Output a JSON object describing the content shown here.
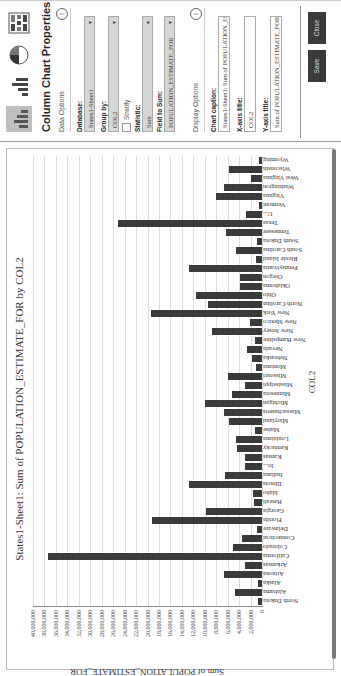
{
  "chart_data": {
    "type": "bar",
    "title": "States1-Sheet1: Sum of POPULATION_ESTIMATE_FOR by COL2",
    "xlabel": "COL2",
    "ylabel": "Sum of POPULATION_ESTIMATE_FOR",
    "ylim": [
      0,
      40000000
    ],
    "yticks": [
      "0",
      "2,000,000",
      "4,000,000",
      "6,000,000",
      "8,000,000",
      "10,000,000",
      "12,000,000",
      "14,000,000",
      "16,000,000",
      "18,000,000",
      "20,000,000",
      "22,000,000",
      "24,000,000",
      "26,000,000",
      "28,000,000",
      "30,000,000",
      "32,000,000",
      "34,000,000",
      "36,000,000",
      "38,000,000",
      "40,000,000"
    ],
    "grid": true,
    "legend": "none",
    "categories": [
      "North Dakota",
      "Alabama",
      "Alaska",
      "Arizona",
      "Arkansas",
      "California",
      "Colorado",
      "Connecticut",
      "Delaware",
      "Florida",
      "Georgia",
      "Hawaii",
      "Idaho",
      "Illinois",
      "Indiana",
      "Io...",
      "Kansas",
      "Kentucky",
      "Louisiana",
      "Maine",
      "Maryland",
      "Massachusetts",
      "Michigan",
      "Minnesota",
      "Mississippi",
      "Missouri",
      "Montana",
      "Nebraska",
      "Nevada",
      "New Hampshire",
      "New Jersey",
      "New Mexico",
      "New York",
      "North Carolina",
      "Ohio",
      "Oklahoma",
      "Oregon",
      "Pennsylvania",
      "Rhode Island",
      "South Carolina",
      "South Dakota",
      "Tennessee",
      "Texas",
      "U...",
      "Vermont",
      "Virginia",
      "Washington",
      "West Virginia",
      "Wisconsin",
      "Wyoming"
    ],
    "values": [
      700000,
      4700000,
      700000,
      6600000,
      2900000,
      37300000,
      5100000,
      3500000,
      900000,
      19300000,
      9800000,
      1400000,
      1600000,
      12800000,
      6500000,
      3000000,
      2900000,
      4300000,
      4600000,
      1300000,
      5800000,
      6600000,
      9900000,
      5300000,
      3000000,
      6000000,
      1000000,
      1800000,
      2700000,
      1300000,
      8800000,
      2100000,
      19400000,
      9500000,
      11500000,
      3800000,
      3800000,
      12700000,
      1100000,
      4600000,
      800000,
      6300000,
      25100000,
      2800000,
      600000,
      8000000,
      6700000,
      1900000,
      5700000,
      600000
    ],
    "bar_color": "#3a3a3a"
  },
  "panel": {
    "chart_types": [
      {
        "name": "column-chart-icon",
        "active": true
      },
      {
        "name": "bar-chart-icon",
        "active": false
      },
      {
        "name": "pie-chart-icon",
        "active": false
      },
      {
        "name": "grid-chart-icon",
        "active": false
      }
    ],
    "title": "Column Chart Properties",
    "data_options": {
      "heading": "Data Options",
      "database_label": "Database:",
      "database_value": "States1-Sheet1",
      "groupby_label": "Group by:",
      "groupby_value": "COL2",
      "stratify_label": "Stratify",
      "statistic_label": "Statistic:",
      "statistic_value": "Sum",
      "field_label": "Field to Sum:",
      "field_value": "POPULATION_ESTIMATE_FOR"
    },
    "display_options": {
      "heading": "Display Options",
      "caption_label": "Chart caption:",
      "caption_value": "States1-Sheet1: Sum of POPULATION_ESTIMATE_F",
      "xaxis_label": "X-axis title:",
      "xaxis_value": "COL2",
      "yaxis_label": "Y-axis title:",
      "yaxis_value": "Sum of POPULATION_ESTIMATE_FOR"
    },
    "buttons": {
      "save": "Save",
      "close": "Close"
    }
  }
}
